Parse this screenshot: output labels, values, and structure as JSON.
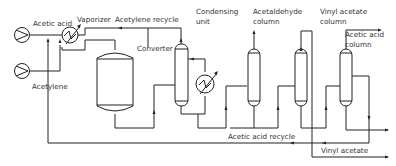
{
  "diagram": {
    "type": "process flow diagram",
    "labels": {
      "acetic_acid": "Acetic acid",
      "acetylene": "Acetylene",
      "vaporizer": "Vaporizer",
      "acetylene_recycle": "Acetylene recycle",
      "converter": "Converter",
      "condensing_unit_1": "Condensing",
      "condensing_unit_2": "unit",
      "acetaldehyde_column_1": "Acetaldehyde",
      "acetaldehyde_column_2": "column",
      "vinyl_acetate_column_1": "Vinyl acetate",
      "vinyl_acetate_column_2": "column",
      "acetic_acid_column_1": "Acetic acid",
      "acetic_acid_column_2": "column",
      "acetic_acid_recycle": "Acetic acid recycle",
      "vinyl_acetate": "Vinyl acetate"
    },
    "equipment": [
      "Acetic acid pump",
      "Acetylene compressor",
      "Vaporizer",
      "Converter",
      "Condensing unit",
      "Heat exchanger",
      "Acetaldehyde column",
      "Vinyl acetate column",
      "Acetic acid column"
    ],
    "colors": {
      "line": "#222222",
      "background": "#ffffff",
      "text": "#333333"
    }
  }
}
